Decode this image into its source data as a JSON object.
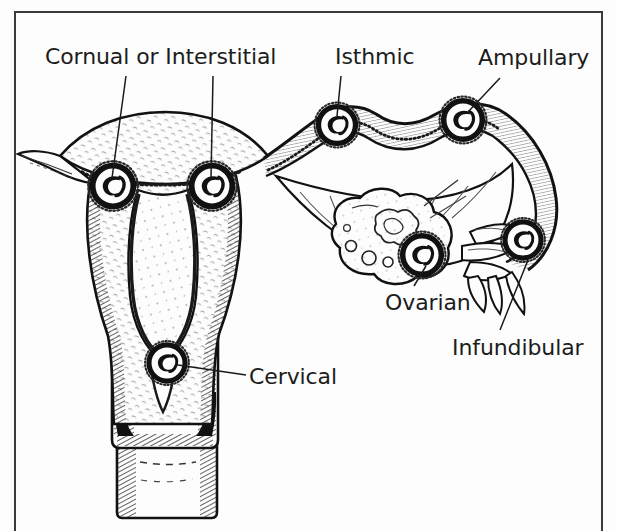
{
  "figure": {
    "kind": "anatomical-line-drawing",
    "background_color": "#fdfdfd",
    "ink_color": "#1a1a1a",
    "label_color": "#1c1c1c",
    "frame": {
      "color": "#3a3a3a",
      "sides": "left-top-right"
    }
  },
  "labels": {
    "cornual": "Cornual or Interstitial",
    "isthmic": "Isthmic",
    "ampullary": "Ampullary",
    "ovarian": "Ovarian",
    "infundibular": "Infundibular",
    "cervical": "Cervical"
  },
  "implantation_sites": [
    {
      "name": "cornual",
      "label": "Cornual or Interstitial",
      "x": 113,
      "y": 186
    },
    {
      "name": "interstitial",
      "label": "Cornual or Interstitial",
      "x": 212,
      "y": 186
    },
    {
      "name": "isthmic",
      "label": "Isthmic",
      "x": 337,
      "y": 125
    },
    {
      "name": "ampullary",
      "label": "Ampullary",
      "x": 463,
      "y": 120
    },
    {
      "name": "ovarian",
      "label": "Ovarian",
      "x": 422,
      "y": 255
    },
    {
      "name": "infundibular",
      "label": "Infundibular",
      "x": 523,
      "y": 240
    },
    {
      "name": "cervical",
      "label": "Cervical",
      "x": 167,
      "y": 363
    }
  ],
  "leader_lines": [
    {
      "from": "cornual-label",
      "x1": 126,
      "y1": 76,
      "x2": 112,
      "y2": 178
    },
    {
      "from": "interstitial-label",
      "x1": 213,
      "y1": 76,
      "x2": 211,
      "y2": 178
    },
    {
      "from": "isthmic-label",
      "x1": 341,
      "y1": 76,
      "x2": 337,
      "y2": 116
    },
    {
      "from": "ampullary-label",
      "x1": 500,
      "y1": 78,
      "x2": 468,
      "y2": 112
    },
    {
      "from": "ovarian-label",
      "x1": 414,
      "y1": 286,
      "x2": 426,
      "y2": 266
    },
    {
      "from": "infundibular-label",
      "x1": 500,
      "y1": 330,
      "x2": 528,
      "y2": 260
    },
    {
      "from": "cervical-label",
      "x1": 246,
      "y1": 375,
      "x2": 178,
      "y2": 365
    }
  ],
  "anatomy_parts": [
    "uterine-fundus",
    "uterine-body",
    "endometrial-cavity",
    "myometrium",
    "cervix",
    "cervical-canal",
    "vaginal-fornix",
    "vagina",
    "broad-ligament",
    "fallopian-tube-isthmus",
    "fallopian-tube-ampulla",
    "fallopian-tube-infundibulum",
    "fimbriae",
    "ovary",
    "ovarian-follicles",
    "corpus-luteum"
  ]
}
